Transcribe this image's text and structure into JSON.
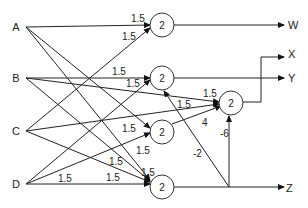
{
  "diagram": {
    "type": "neural-network",
    "inputs": [
      {
        "id": "A",
        "label": "A",
        "x": 22,
        "y": 27
      },
      {
        "id": "B",
        "label": "B",
        "x": 22,
        "y": 77
      },
      {
        "id": "C",
        "label": "C",
        "x": 22,
        "y": 130
      },
      {
        "id": "D",
        "label": "D",
        "x": 22,
        "y": 183
      }
    ],
    "nodes": [
      {
        "id": "N1",
        "threshold": "2",
        "x": 162,
        "y": 25
      },
      {
        "id": "N2",
        "threshold": "2",
        "x": 162,
        "y": 77
      },
      {
        "id": "N3",
        "threshold": "2",
        "x": 162,
        "y": 131
      },
      {
        "id": "N4",
        "threshold": "2",
        "x": 162,
        "y": 183
      },
      {
        "id": "N5",
        "threshold": "2",
        "x": 232,
        "y": 102
      }
    ],
    "outputs": [
      {
        "id": "W",
        "label": "W"
      },
      {
        "id": "X",
        "label": "X"
      },
      {
        "id": "Y",
        "label": "Y"
      },
      {
        "id": "Z",
        "label": "Z"
      }
    ],
    "edges": [
      {
        "from": "A",
        "to": "N1",
        "weight": "1.5"
      },
      {
        "from": "A",
        "to": "N3",
        "weight": ""
      },
      {
        "from": "A",
        "to": "N4",
        "weight": ""
      },
      {
        "from": "B",
        "to": "N2",
        "weight": "1.5"
      },
      {
        "from": "B",
        "to": "N5",
        "weight": "1.5"
      },
      {
        "from": "B",
        "to": "N4",
        "weight": ""
      },
      {
        "from": "C",
        "to": "N1",
        "weight": "1.5"
      },
      {
        "from": "C",
        "to": "N5",
        "weight": "1.5"
      },
      {
        "from": "C",
        "to": "N4",
        "weight": "1.5"
      },
      {
        "from": "D",
        "to": "N2",
        "weight": "1.5"
      },
      {
        "from": "D",
        "to": "N3",
        "weight": "1.5"
      },
      {
        "from": "D",
        "to": "N4",
        "weight": "1.5"
      },
      {
        "from": "N3",
        "to": "N5",
        "weight": "4"
      },
      {
        "from": "N4",
        "to": "N5",
        "weight": "-6"
      },
      {
        "from": "N4",
        "to": "N2",
        "weight": "-2"
      },
      {
        "from": "N1",
        "to": "W",
        "weight": ""
      },
      {
        "from": "N2",
        "to": "Y",
        "weight": ""
      },
      {
        "from": "N5",
        "to": "X",
        "weight": ""
      },
      {
        "from": "N4",
        "to": "Z",
        "weight": ""
      }
    ],
    "weight_labels": {
      "a_n1": "1.5",
      "c_n1": "1.5",
      "b_n2": "1.5",
      "d_n2": "1.5",
      "b_n5": "1.5",
      "c_n5": "1.5",
      "n3_n5": "4",
      "n4_n5": "-6",
      "n4_n2": "-2",
      "d_n3": "1.5",
      "a_n3": "1.5",
      "c_n4": "1.5",
      "b_n4": "1.5",
      "a_n4": "1.5",
      "d_n4": "1.5"
    }
  }
}
